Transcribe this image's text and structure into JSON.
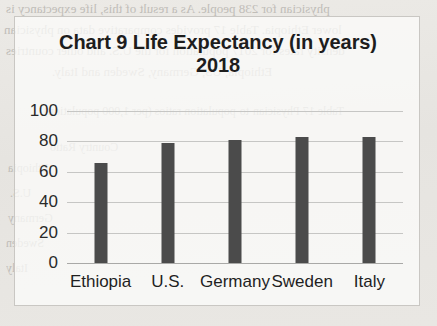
{
  "background": {
    "scan_lines": [
      "physician for 238 people.  As a result of this, life expectancy is",
      "lower Ethiopia.  Table 17 provides comparative data on physician",
      "density rates for 2017 population for the U.S. and other countries",
      "Ethiopia, US, Germany, Sweden and Italy.",
      "Table 17 Physician-to-population ratios (per 1,000 population)",
      "Country                                    Ratio",
      "Ethiopia",
      "U.S.",
      "Germany",
      "Sweden",
      "Italy"
    ]
  },
  "chart_data": {
    "type": "bar",
    "title": "Chart 9  Life Expectancy (in years) 2018",
    "xlabel": "",
    "ylabel": "",
    "categories": [
      "Ethiopia",
      "U.S.",
      "Germany",
      "Sweden",
      "Italy"
    ],
    "values": [
      66,
      79,
      81,
      83,
      83
    ],
    "ylim": [
      0,
      100
    ],
    "yticks": [
      0,
      20,
      40,
      60,
      80,
      100
    ],
    "ytick_labels": [
      "0",
      "20",
      "40",
      "60",
      "80",
      "100"
    ],
    "grid": true,
    "legend": false,
    "bar_color": "#4b4b4b",
    "gridline_color": "#c6c6c4"
  }
}
